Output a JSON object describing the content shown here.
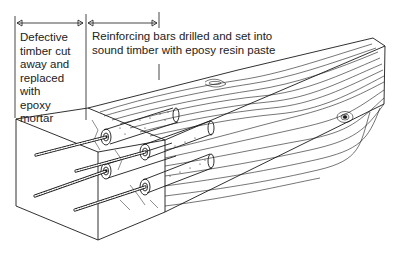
{
  "diagram": {
    "type": "technical-illustration",
    "labels": {
      "defective_zone": "Defective\ntimber cut\naway and\nreplaced with\nepoxy mortar",
      "reinforcing_zone": "Reinforcing bars drilled and set into\nsound timber with eposy resin paste"
    },
    "dimension_markers": [
      {
        "name": "defective-zone-extent",
        "x1": 16,
        "x2": 84,
        "y": 23
      },
      {
        "name": "reinforcing-zone-extent",
        "x1": 87,
        "x2": 158,
        "y": 23
      }
    ],
    "components": {
      "rebar_count": 4,
      "epoxy_core_count": 4,
      "knots_count": 2
    },
    "colors": {
      "line": "#1a1a1a",
      "background": "#ffffff"
    }
  }
}
